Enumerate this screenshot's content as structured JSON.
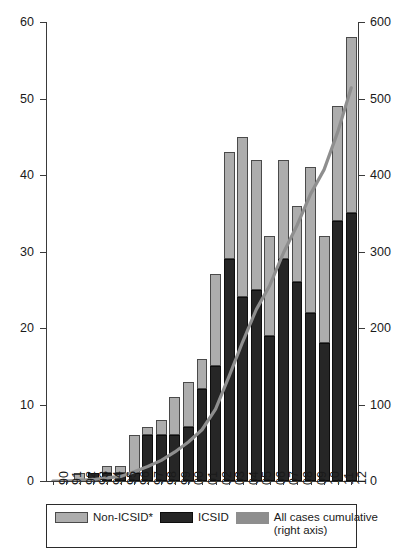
{
  "chart_data": {
    "type": "bar",
    "title": "",
    "subtitle": "",
    "xlabel": "",
    "ylabel": "",
    "y2label": "",
    "grid": false,
    "legend_position": "bottom",
    "categories": [
      "90",
      "91",
      "92",
      "93",
      "94",
      "95",
      "96",
      "97",
      "98",
      "99",
      "00",
      "01",
      "02",
      "03",
      "04",
      "05",
      "06",
      "07",
      "08",
      "09",
      "10",
      "11",
      "12"
    ],
    "ylim": [
      0,
      60
    ],
    "yticks": [
      0,
      10,
      20,
      30,
      40,
      50,
      60
    ],
    "y2lim": [
      0,
      600
    ],
    "y2ticks": [
      0,
      100,
      200,
      300,
      400,
      500,
      600
    ],
    "stacked": true,
    "series": [
      {
        "name": "ICSID",
        "axis": "left",
        "color": "#262626",
        "values": [
          0,
          0,
          0,
          1,
          1,
          1,
          1,
          6,
          6,
          6,
          7,
          12,
          15,
          29,
          24,
          25,
          19,
          29,
          26,
          22,
          18,
          34,
          35
        ]
      },
      {
        "name": "Non-ICSID*",
        "axis": "left",
        "color": "#adadad",
        "values": [
          0,
          0,
          1,
          0,
          1,
          1,
          5,
          1,
          2,
          5,
          6,
          4,
          12,
          14,
          21,
          17,
          13,
          13,
          10,
          19,
          14,
          15,
          23
        ]
      },
      {
        "name": "All cases cumulative (right axis)",
        "type": "line",
        "axis": "right",
        "color": "#8e8e8e",
        "values": [
          0,
          0,
          1,
          2,
          4,
          6,
          12,
          19,
          27,
          38,
          51,
          67,
          94,
          137,
          182,
          224,
          256,
          298,
          334,
          375,
          407,
          456,
          514
        ]
      }
    ],
    "totals": [
      0,
      0,
      1,
      1,
      2,
      2,
      6,
      7,
      8,
      11,
      13,
      16,
      27,
      43,
      45,
      42,
      32,
      42,
      36,
      41,
      32,
      49,
      58
    ]
  },
  "legend": {
    "items": [
      {
        "label": "Non-ICSID*",
        "swatch": "nonicsid"
      },
      {
        "label": "ICSID",
        "swatch": "icsid"
      },
      {
        "label": "All cases cumulative",
        "label2": "(right axis)",
        "swatch": "line"
      }
    ]
  },
  "colors": {
    "icsid": "#262626",
    "non_icsid": "#adadad",
    "cumulative_line": "#8e8e8e",
    "axis": "#3a3a3a",
    "background": "#ffffff"
  }
}
